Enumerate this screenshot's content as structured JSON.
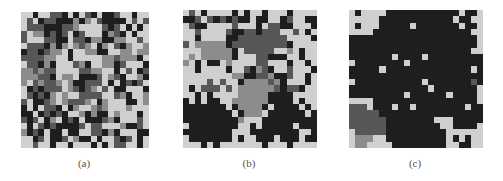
{
  "figure": {
    "palette": {
      "0": "#1e1e1e",
      "1": "#575757",
      "2": "#8c8c8c",
      "3": "#cfcfcf"
    },
    "panels": [
      {
        "label": "(a)",
        "box": {
          "x": 21,
          "y": 12,
          "w": 128,
          "h": 136
        },
        "caption_pos": {
          "x": 64,
          "y": 157
        },
        "grid": [
          "3303311030310300133033",
          "3130110002023100003131",
          "3111000112333310130303",
          "1322010130133302103033",
          "1333110031102200223313",
          "3111020232123023102332",
          "0110122303322003322322",
          "1111223303333322122203",
          "3110203331203322013330",
          "2212113333112233031301",
          "2221103223000132103320",
          "2312112320011130301013",
          "3010111321012313003330",
          "3101023233111133120332",
          "1300123211123023330032",
          "0303110302332123332333",
          "0030101033202003233303",
          "1013023010300012033313",
          "3031010000131133320013",
          "2010300300331102033300",
          "3301300132003033101303",
          "3313303303330303113303"
        ]
      },
      {
        "label": "(b)",
        "box": {
          "x": 183,
          "y": 10,
          "w": 134,
          "h": 138
        },
        "caption_pos": {
          "x": 229,
          "y": 157
        },
        "grid": [
          "3130333303033033303333",
          "0013101010030033013300",
          "3100333313330311003330",
          "3313333100110111331303",
          "3303333001111111133330",
          "1322222011111111103333",
          "3332222203111113323033",
          "3232222203331100033033",
          "2303003233331133303303",
          "3303333033102103313330",
          "3333333322001120013303",
          "3333131330222212033303",
          "3031113132222221011033",
          "3303033332222200003333",
          "0303003322222200003033",
          "0000000302222030000303",
          "0000000030222300000030",
          "0000000002333000000000",
          "3000000003303000003000",
          "0000000033300000000330",
          "3000000030330003000300",
          "3330303333333033303333"
        ]
      },
      {
        "label": "(c)",
        "box": {
          "x": 349,
          "y": 10,
          "w": 134,
          "h": 138
        },
        "caption_pos": {
          "x": 395,
          "y": 157
        },
        "grid": [
          "3033330000000000003003",
          "3333300000000000030033",
          "3033300000300000003003",
          "3333000000000000000033",
          "0000000000000000000003",
          "0000000000000000000003",
          "0000000000000000000033",
          "0000000300003000000000",
          "3000000003000000000000",
          "0000030000000000000030",
          "0000000000000000000000",
          "3000000000003000000010",
          "0000000000000300000003",
          "0000000003000000300003",
          "3333000000000000000003",
          "1113000300300000000300",
          "1111100000000000000000",
          "1111110000000033300000",
          "1111110000000003300003",
          "3111110000000000333333",
          "3222330000000000303033",
          "3223333000000000330033"
        ]
      }
    ]
  }
}
